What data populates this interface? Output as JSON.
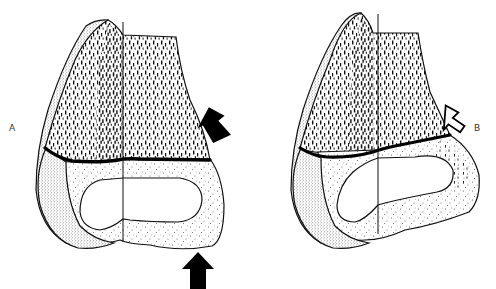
{
  "figure": {
    "type": "anatomical line illustration",
    "panels": [
      {
        "id": "A",
        "label": "A",
        "arrows": [
          {
            "style": "solid-black",
            "direction": "down-left",
            "position": "right side, upper"
          },
          {
            "style": "solid-black",
            "direction": "up",
            "position": "below bone"
          }
        ]
      },
      {
        "id": "B",
        "label": "B",
        "arrows": [
          {
            "style": "outlined-white",
            "direction": "down-left",
            "position": "right side, upper"
          }
        ]
      }
    ]
  },
  "colors": {
    "ink": "#111111",
    "background": "#ffffff",
    "stipple": "#555555"
  }
}
